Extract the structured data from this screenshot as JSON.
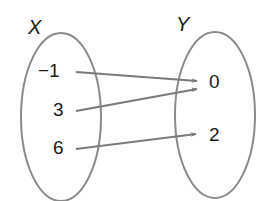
{
  "diagram": {
    "type": "mapping-diagram",
    "domain_set": {
      "name": "X",
      "elements": [
        "−1",
        "3",
        "6"
      ]
    },
    "codomain_set": {
      "name": "Y",
      "elements": [
        "0",
        "2"
      ]
    },
    "mappings": [
      {
        "from": "−1",
        "to": "0"
      },
      {
        "from": "3",
        "to": "0"
      },
      {
        "from": "6",
        "to": "2"
      }
    ],
    "colors": {
      "ellipse_stroke": "#8a8a8a",
      "arrow_stroke": "#7a7a7a",
      "text": "#1a1a1a"
    }
  }
}
